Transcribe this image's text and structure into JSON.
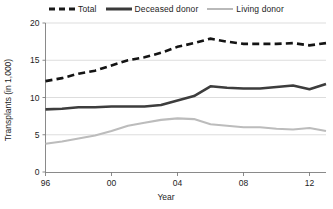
{
  "legend": {
    "entries": [
      {
        "label": "Total",
        "style": "dashed",
        "color": "#141414",
        "icon": "dashed-line-icon"
      },
      {
        "label": "Deceased donor",
        "style": "solid",
        "color": "#3d3d3d",
        "icon": "solid-line-icon"
      },
      {
        "label": "Living donor",
        "style": "solid",
        "color": "#bcbcbc",
        "icon": "light-line-icon"
      }
    ]
  },
  "chart_data": {
    "type": "line",
    "title": "",
    "xlabel": "Year",
    "ylabel": "Transplants (in 1,000)",
    "xlim": [
      1996,
      2013
    ],
    "ylim": [
      0,
      20
    ],
    "yticks": [
      0,
      5,
      10,
      15,
      20
    ],
    "ytick_labels": [
      "0",
      "5",
      "10",
      "15",
      "20"
    ],
    "xticks": [
      1996,
      2000,
      2004,
      2008,
      2012
    ],
    "xtick_labels": [
      "96",
      "00",
      "04",
      "08",
      "12"
    ],
    "grid": "horizontal",
    "legend_position": "top-center",
    "x": [
      1996,
      1997,
      1998,
      1999,
      2000,
      2001,
      2002,
      2003,
      2004,
      2005,
      2006,
      2007,
      2008,
      2009,
      2010,
      2011,
      2012,
      2013
    ],
    "series": [
      {
        "name": "Total",
        "color": "#141414",
        "style": "dashed",
        "values": [
          12.2,
          12.6,
          13.2,
          13.6,
          14.3,
          15.0,
          15.4,
          16.0,
          16.8,
          17.3,
          17.9,
          17.5,
          17.2,
          17.2,
          17.2,
          17.3,
          17.0,
          17.3
        ]
      },
      {
        "name": "Deceased donor",
        "color": "#3d3d3d",
        "style": "solid",
        "values": [
          8.4,
          8.5,
          8.7,
          8.7,
          8.8,
          8.8,
          8.8,
          9.0,
          9.6,
          10.2,
          11.5,
          11.3,
          11.2,
          11.2,
          11.4,
          11.6,
          11.1,
          11.8
        ]
      },
      {
        "name": "Living donor",
        "color": "#bcbcbc",
        "style": "solid",
        "values": [
          3.8,
          4.1,
          4.5,
          4.9,
          5.5,
          6.2,
          6.6,
          7.0,
          7.2,
          7.1,
          6.4,
          6.2,
          6.0,
          6.0,
          5.8,
          5.7,
          5.9,
          5.5
        ]
      }
    ]
  }
}
